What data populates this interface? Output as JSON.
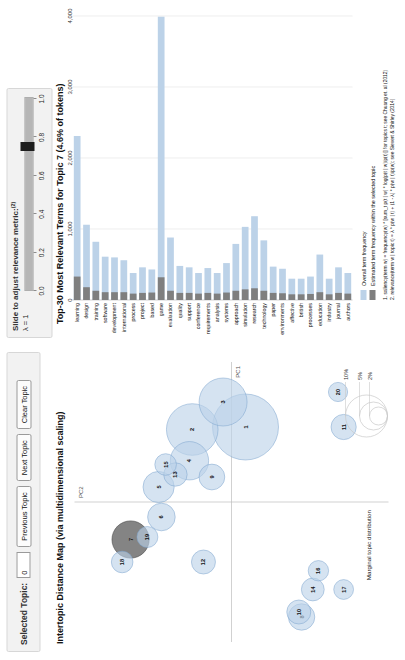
{
  "controls": {
    "selected_topic_label": "Selected Topic:",
    "selected_topic_value": "0",
    "previous_topic": "Previous Topic",
    "next_topic": "Next Topic",
    "clear_topic": "Clear Topic"
  },
  "slider": {
    "title": "Slide to adjust relevance metric:",
    "title_superscript": "(2)",
    "lambda_label": "λ = 1",
    "value": 1.0,
    "ticks": [
      "0.0",
      "0.2",
      "0.4",
      "0.6",
      "0.8",
      "1.0"
    ]
  },
  "map": {
    "title": "Intertopic Distance Map (via multidimensional scaling)",
    "xaxis": "PC1",
    "yaxis": "PC2",
    "legend_title": "Marginal topic distribution",
    "legend_sizes": [
      "2%",
      "5%",
      "10%"
    ]
  },
  "bar": {
    "title": "Top-30 Most Relevant Terms for Topic 7 (4.6% of tokens)",
    "legend_overall": "Overall term frequency",
    "legend_estimated": "Estimated term frequency within the selected topic",
    "footnote1": "1. saliency(term w) = frequency(w) * [sum_t p(t | w) * log(p(t | w)/p(t))] for topics t; see Chuang et. al (2012)",
    "footnote2": "2. relevance(term w | topic t) = λ * p(w | t) + (1 - λ) * p(w | t)/p(w); see Sievert & Shirley (2014)"
  },
  "chart_data": [
    {
      "type": "bar",
      "title": "Top-30 Most Relevant Terms for Topic 7 (4.6% of tokens)",
      "xlabel": "",
      "ylabel": "",
      "xlim": [
        0,
        4000
      ],
      "grid": true,
      "orientation": "horizontal",
      "xticks": [
        "0",
        "1,000",
        "2,000",
        "3,000",
        "4,000"
      ],
      "legend": [
        "Overall term frequency",
        "Estimated term frequency within the selected topic"
      ],
      "categories": [
        "learning",
        "design",
        "training",
        "software",
        "development",
        "international",
        "process",
        "project",
        "based",
        "game",
        "evaluation",
        "quality",
        "support",
        "conference",
        "requirements",
        "analysis",
        "systems",
        "approach",
        "simulation",
        "research",
        "technology",
        "paper",
        "environments",
        "affective",
        "british",
        "processes",
        "education",
        "industry",
        "journal",
        "authors"
      ],
      "series": [
        {
          "name": "Overall term frequency",
          "values": [
            2310,
            1060,
            820,
            610,
            600,
            560,
            380,
            460,
            430,
            3990,
            880,
            480,
            460,
            380,
            450,
            380,
            520,
            790,
            1030,
            1180,
            840,
            470,
            440,
            300,
            300,
            330,
            640,
            300,
            460,
            380
          ]
        },
        {
          "name": "Estimated term frequency within the selected topic",
          "values": [
            330,
            180,
            130,
            110,
            110,
            110,
            90,
            100,
            105,
            320,
            130,
            100,
            100,
            90,
            100,
            90,
            105,
            130,
            150,
            165,
            130,
            100,
            95,
            80,
            80,
            85,
            110,
            80,
            100,
            90
          ]
        }
      ]
    },
    {
      "type": "scatter",
      "title": "Intertopic Distance Map (via multidimensional scaling)",
      "xlabel": "PC1",
      "ylabel": "PC2",
      "grid": false,
      "points": [
        {
          "topic": 1,
          "x": 0.6,
          "y": -0.1,
          "size": 11.0,
          "selected": false
        },
        {
          "topic": 2,
          "x": 0.58,
          "y": 0.28,
          "size": 8.6,
          "selected": false
        },
        {
          "topic": 3,
          "x": 0.8,
          "y": 0.06,
          "size": 8.0,
          "selected": false
        },
        {
          "topic": 4,
          "x": 0.33,
          "y": 0.3,
          "size": 6.4,
          "selected": false
        },
        {
          "topic": 5,
          "x": 0.12,
          "y": 0.52,
          "size": 5.2,
          "selected": false
        },
        {
          "topic": 6,
          "x": -0.12,
          "y": 0.5,
          "size": 4.6,
          "selected": false
        },
        {
          "topic": 7,
          "x": -0.3,
          "y": 0.72,
          "size": 6.2,
          "selected": true
        },
        {
          "topic": 8,
          "x": -0.92,
          "y": -0.5,
          "size": 4.4,
          "selected": false
        },
        {
          "topic": 9,
          "x": 0.2,
          "y": 0.14,
          "size": 4.3,
          "selected": false
        },
        {
          "topic": 10,
          "x": -0.88,
          "y": -0.48,
          "size": 4.0,
          "selected": false
        },
        {
          "topic": 11,
          "x": 0.6,
          "y": -0.8,
          "size": 4.2,
          "selected": false
        },
        {
          "topic": 12,
          "x": -0.48,
          "y": 0.2,
          "size": 4.0,
          "selected": false
        },
        {
          "topic": 13,
          "x": 0.22,
          "y": 0.4,
          "size": 3.9,
          "selected": false
        },
        {
          "topic": 14,
          "x": -0.7,
          "y": -0.58,
          "size": 3.8,
          "selected": false
        },
        {
          "topic": 15,
          "x": 0.3,
          "y": 0.47,
          "size": 3.6,
          "selected": false
        },
        {
          "topic": 16,
          "x": -0.55,
          "y": -0.62,
          "size": 3.4,
          "selected": false
        },
        {
          "topic": 17,
          "x": -0.7,
          "y": -0.8,
          "size": 3.3,
          "selected": false
        },
        {
          "topic": 18,
          "x": -0.48,
          "y": 0.78,
          "size": 3.6,
          "selected": false
        },
        {
          "topic": 19,
          "x": -0.28,
          "y": 0.6,
          "size": 3.5,
          "selected": false
        },
        {
          "topic": 20,
          "x": 0.88,
          "y": -0.76,
          "size": 3.2,
          "selected": false
        }
      ]
    }
  ]
}
